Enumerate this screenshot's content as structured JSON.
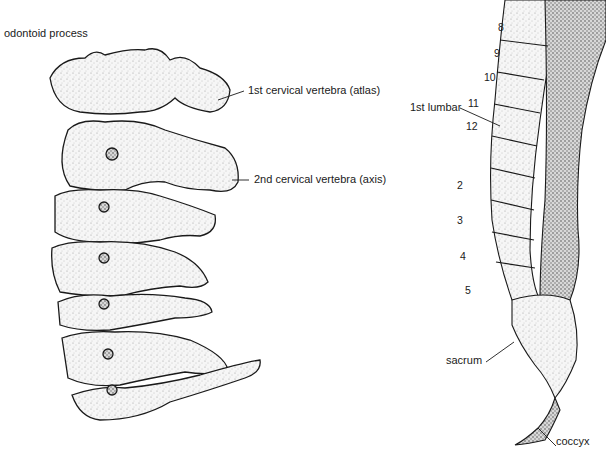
{
  "cervical": {
    "labels": {
      "odontoid": "odontoid process",
      "atlas": "1st cervical vertebra (atlas)",
      "axis": "2nd cervical vertebra (axis)"
    }
  },
  "spine": {
    "thoracic_numbers": [
      "8",
      "9",
      "10",
      "11",
      "12"
    ],
    "lumbar_label": "1st lumbar",
    "lumbar_numbers": [
      "2",
      "3",
      "4",
      "5"
    ],
    "sacrum": "sacrum",
    "coccyx": "coccyx"
  },
  "colors": {
    "ink": "#1a1a1a",
    "bone": "#f4f4f4",
    "stipple": "#9a9a9a"
  }
}
